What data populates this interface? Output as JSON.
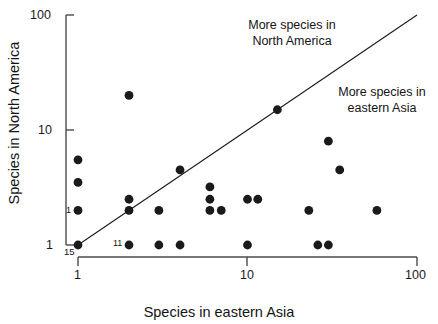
{
  "chart_data": {
    "type": "scatter",
    "title": "",
    "xlabel": "Species in eastern Asia",
    "ylabel": "Species in North America",
    "xscale": "log",
    "yscale": "log",
    "xlim": [
      1,
      100
    ],
    "ylim": [
      1,
      100
    ],
    "grid": false,
    "legend": "none",
    "xticks": [
      {
        "value": 1,
        "label": "1"
      },
      {
        "value": 10,
        "label": "10"
      },
      {
        "value": 100,
        "label": "100"
      }
    ],
    "yticks": [
      {
        "value": 1,
        "label": "1"
      },
      {
        "value": 10,
        "label": "10"
      },
      {
        "value": 100,
        "label": "100"
      }
    ],
    "reference_line": {
      "description": "1:1 diagonal line",
      "from": [
        1,
        1
      ],
      "to": [
        100,
        100
      ]
    },
    "annotations": [
      {
        "id": "more-north-america",
        "text": "More species in\nNorth America"
      },
      {
        "id": "more-eastern-asia",
        "text": "More species in\neastern Asia"
      }
    ],
    "series": [
      {
        "name": "Genus pairs",
        "marker": "filled-circle",
        "color": "#1a1a1a",
        "points": [
          {
            "x": 1,
            "y": 5.5
          },
          {
            "x": 1,
            "y": 3.5
          },
          {
            "x": 1,
            "y": 2,
            "label": "1"
          },
          {
            "x": 1,
            "y": 1
          },
          {
            "x": 2,
            "y": 20
          },
          {
            "x": 2,
            "y": 2.5
          },
          {
            "x": 2,
            "y": 2
          },
          {
            "x": 2,
            "y": 1,
            "label": "11"
          },
          {
            "x": 3,
            "y": 2
          },
          {
            "x": 3,
            "y": 1
          },
          {
            "x": 4,
            "y": 4.5
          },
          {
            "x": 4,
            "y": 1
          },
          {
            "x": 6,
            "y": 3.2
          },
          {
            "x": 6,
            "y": 2.5
          },
          {
            "x": 6,
            "y": 2
          },
          {
            "x": 7,
            "y": 2
          },
          {
            "x": 10,
            "y": 2.5
          },
          {
            "x": 10,
            "y": 1
          },
          {
            "x": 11.5,
            "y": 2.5
          },
          {
            "x": 15,
            "y": 15
          },
          {
            "x": 23,
            "y": 2
          },
          {
            "x": 26,
            "y": 1
          },
          {
            "x": 30,
            "y": 8
          },
          {
            "x": 30,
            "y": 1
          },
          {
            "x": 35,
            "y": 4.5
          },
          {
            "x": 58,
            "y": 2
          }
        ]
      }
    ],
    "extra_labels": [
      {
        "id": "y-origin-count",
        "text": "15",
        "near": "y-axis origin"
      }
    ]
  },
  "axes": {
    "x_title": "Species in eastern Asia",
    "y_title": "Species in North America",
    "x_tick_labels": [
      "1",
      "10",
      "100"
    ],
    "y_tick_labels": [
      "1",
      "10",
      "100"
    ],
    "origin_count_label": "15"
  },
  "annotations": {
    "north_america": "More species in\nNorth America",
    "eastern_asia": "More species in\neastern Asia"
  },
  "point_labels": {
    "left_one": "1",
    "bottom_eleven": "11"
  },
  "colors": {
    "marker": "#1a1a1a",
    "axis": "#4a4a4a",
    "line": "#1a1a1a",
    "background": "#ffffff",
    "text": "#141414"
  }
}
